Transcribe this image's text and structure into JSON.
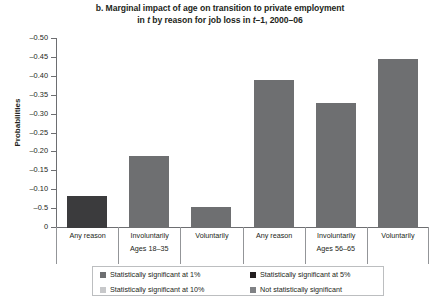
{
  "chart_data": {
    "type": "bar",
    "title_line1_pre": "b. Marginal impact of age on transition to private employment",
    "title_line2_a": "in ",
    "title_line2_t1": "t",
    "title_line2_b": " by reason for job loss in ",
    "title_line2_t2": "t",
    "title_line2_c": "–1, 2000–06",
    "xlabel": "",
    "ylabel": "Probabilities",
    "ylim": [
      -0.5,
      0
    ],
    "yticks": [
      -0.5,
      -0.45,
      -0.4,
      -0.35,
      -0.3,
      -0.25,
      -0.2,
      -0.15,
      -0.1,
      -0.05,
      0
    ],
    "ytick_labels": [
      "–0.50",
      "–0.45",
      "–0.40",
      "–0.35",
      "–0.30",
      "–0.25",
      "–0.20",
      "–0.15",
      "–0.10",
      "–0.5",
      "0"
    ],
    "grid": false,
    "legend_position": "bottom",
    "axis_inverted": true,
    "categories": [
      "Any reason",
      "Involuntarily",
      "Voluntarily",
      "Any reason",
      "Involuntarily",
      "Voluntarily"
    ],
    "groups": [
      {
        "label": "Ages 18–35",
        "categories": [
          "Any reason",
          "Involuntarily",
          "Voluntarily"
        ]
      },
      {
        "label": "Ages 56–65",
        "categories": [
          "Any reason",
          "Involuntarily",
          "Voluntarily"
        ]
      }
    ],
    "values": [
      -0.085,
      -0.19,
      -0.055,
      -0.39,
      -0.33,
      -0.445
    ],
    "bars": [
      {
        "group": "Ages 18–35",
        "category": "Any reason",
        "value": -0.085,
        "significance": "Statistically significant at 5%",
        "color": "#3b3b3d"
      },
      {
        "group": "Ages 18–35",
        "category": "Involuntarily",
        "value": -0.19,
        "significance": "Statistically significant at 1%",
        "color": "#6e6f71"
      },
      {
        "group": "Ages 18–35",
        "category": "Voluntarily",
        "value": -0.055,
        "significance": "Statistically significant at 1%",
        "color": "#6e6f71"
      },
      {
        "group": "Ages 56–65",
        "category": "Any reason",
        "value": -0.39,
        "significance": "Statistically significant at 1%",
        "color": "#6e6f71"
      },
      {
        "group": "Ages 56–65",
        "category": "Involuntarily",
        "value": -0.33,
        "significance": "Statistically significant at 1%",
        "color": "#6e6f71"
      },
      {
        "group": "Ages 56–65",
        "category": "Voluntarily",
        "value": -0.445,
        "significance": "Statistically significant at 1%",
        "color": "#6e6f71"
      }
    ],
    "legend": [
      {
        "label": "Statistically significant at 1%",
        "color": "#6e6f71"
      },
      {
        "label": "Statistically significant at 5%",
        "color": "#231f20"
      },
      {
        "label": "Statistically significant at 10%",
        "color": "#c7c8ca"
      },
      {
        "label": "Not statistically significant",
        "color": "#808285"
      }
    ]
  }
}
